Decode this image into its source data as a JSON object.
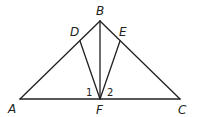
{
  "diagram": {
    "type": "geometry",
    "points": {
      "A": {
        "label": "A"
      },
      "B": {
        "label": "B"
      },
      "C": {
        "label": "C"
      },
      "D": {
        "label": "D"
      },
      "E": {
        "label": "E"
      },
      "F": {
        "label": "F"
      }
    },
    "segments": [
      {
        "name": "AB",
        "from": "A",
        "to": "B"
      },
      {
        "name": "BC",
        "from": "B",
        "to": "C"
      },
      {
        "name": "AC",
        "from": "A",
        "to": "C"
      },
      {
        "name": "BF",
        "from": "B",
        "to": "F"
      },
      {
        "name": "DF",
        "from": "D",
        "to": "F"
      },
      {
        "name": "EF",
        "from": "E",
        "to": "F"
      }
    ],
    "angle_labels": [
      {
        "name": "angle-1",
        "text": "1",
        "vertex": "F",
        "between": [
          "D",
          "B"
        ]
      },
      {
        "name": "angle-2",
        "text": "2",
        "vertex": "F",
        "between": [
          "B",
          "E"
        ]
      }
    ]
  }
}
